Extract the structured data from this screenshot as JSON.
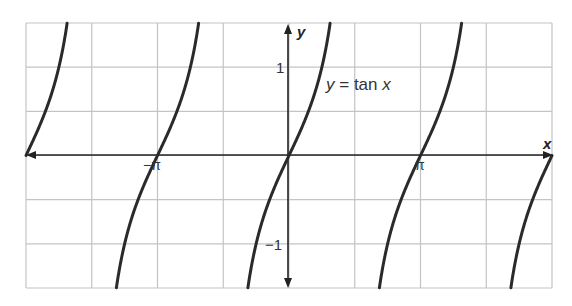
{
  "chart_data": {
    "type": "line",
    "title": "",
    "function_label": "y = tan x",
    "function_label_parts": {
      "lhs": "y",
      "eq": " = ",
      "rhs_fn": "tan ",
      "rhs_var": "x"
    },
    "xlabel": "x",
    "ylabel": "y",
    "xlim": [
      -6.2832,
      6.2832
    ],
    "ylim": [
      -1.5,
      1.5
    ],
    "grid": true,
    "grid_x_step": 1.5708,
    "grid_y_step": 0.5,
    "x_tick_labels": [
      {
        "value": -3.1416,
        "label": "−π"
      },
      {
        "value": 3.1416,
        "label": "π"
      }
    ],
    "y_tick_labels": [
      {
        "value": 1,
        "label": "1"
      },
      {
        "value": -1,
        "label": "−1"
      }
    ],
    "series": [
      {
        "name": "y = tan x",
        "function": "tan",
        "asymptotes": [
          -4.7124,
          -1.5708,
          1.5708,
          4.7124
        ],
        "color": "#2a2a2a"
      }
    ],
    "legend": "none"
  },
  "colors": {
    "grid": "#c4c4c4",
    "axis": "#222222",
    "curve": "#2a2a2a",
    "background": "#ffffff"
  }
}
